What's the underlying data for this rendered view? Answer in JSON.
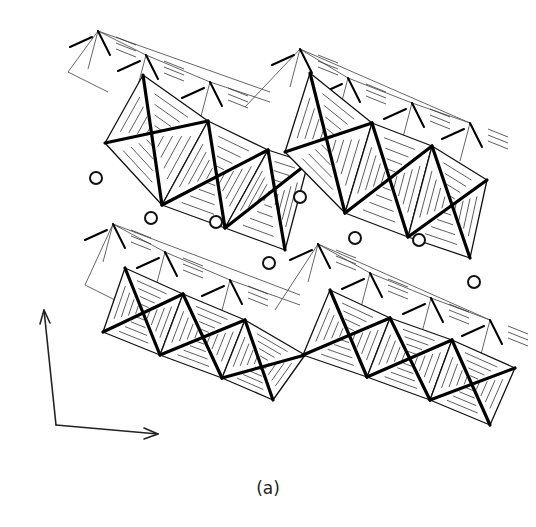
{
  "figure": {
    "type": "crystal-structure-polyhedral-diagram",
    "caption": "(a)",
    "layers": [
      {
        "name": "upper-layer",
        "back_chain": {
          "style": "thin",
          "origin": [
            68,
            72
          ],
          "peaks": [
            [
              98,
              31
            ],
            [
              146,
              55
            ],
            [
              210,
              82
            ],
            [
              270,
              102
            ],
            [
              300,
              49
            ],
            [
              348,
              78
            ],
            [
              412,
              103
            ],
            [
              470,
              123
            ]
          ]
        },
        "front_chains": [
          {
            "offset": [
              0,
              0
            ],
            "octahedra": [
              [
                [
                  143,
                  75
                ],
                [
                  105,
                  143
                ],
                [
                  162,
                  205
                ],
                [
                  208,
                  121
                ]
              ],
              [
                [
                  208,
                  121
                ],
                [
                  162,
                  205
                ],
                [
                  225,
                  228
                ],
                [
                  268,
                  150
                ]
              ],
              [
                [
                  268,
                  150
                ],
                [
                  225,
                  228
                ],
                [
                  285,
                  250
                ],
                [
                  308,
                  163
                ]
              ]
            ]
          },
          {
            "offset": [
              210,
              0
            ],
            "octahedra": [
              [
                [
                  310,
                  73
                ],
                [
                  285,
                  152
                ],
                [
                  345,
                  213
                ],
                [
                  372,
                  123
                ]
              ],
              [
                [
                  372,
                  123
                ],
                [
                  345,
                  213
                ],
                [
                  408,
                  237
                ],
                [
                  432,
                  146
                ]
              ],
              [
                [
                  432,
                  146
                ],
                [
                  408,
                  237
                ],
                [
                  470,
                  258
                ],
                [
                  487,
                  180
                ]
              ]
            ]
          }
        ]
      },
      {
        "name": "lower-layer",
        "back_chain": {
          "style": "thin",
          "origin": [
            85,
            285
          ],
          "peaks": [
            [
              113,
              224
            ],
            [
              165,
              252
            ],
            [
              230,
              280
            ],
            [
              300,
              305
            ],
            [
              318,
              244
            ],
            [
              370,
              273
            ],
            [
              431,
              298
            ],
            [
              490,
              320
            ]
          ]
        },
        "front_chains": [
          {
            "offset": [
              0,
              0
            ],
            "octahedra": [
              [
                [
                  125,
                  268
                ],
                [
                  103,
                  332
                ],
                [
                  160,
                  355
                ],
                [
                  183,
                  294
                ]
              ],
              [
                [
                  183,
                  294
                ],
                [
                  160,
                  355
                ],
                [
                  222,
                  378
                ],
                [
                  245,
                  320
                ]
              ],
              [
                [
                  245,
                  320
                ],
                [
                  222,
                  378
                ],
                [
                  273,
                  400
                ],
                [
                  305,
                  355
                ]
              ]
            ]
          },
          {
            "offset": [
              0,
              0
            ],
            "octahedra": [
              [
                [
                  330,
                  290
                ],
                [
                  303,
                  355
                ],
                [
                  367,
                  377
                ],
                [
                  390,
                  318
                ]
              ],
              [
                [
                  390,
                  318
                ],
                [
                  367,
                  377
                ],
                [
                  430,
                  400
                ],
                [
                  452,
                  340
                ]
              ],
              [
                [
                  452,
                  340
                ],
                [
                  430,
                  400
                ],
                [
                  490,
                  425
                ],
                [
                  515,
                  368
                ]
              ]
            ]
          }
        ]
      }
    ],
    "interlayer_ions": [
      {
        "x": 96,
        "y": 178
      },
      {
        "x": 151,
        "y": 218
      },
      {
        "x": 216,
        "y": 222
      },
      {
        "x": 300,
        "y": 197
      },
      {
        "x": 269,
        "y": 263
      },
      {
        "x": 355,
        "y": 238
      },
      {
        "x": 419,
        "y": 240
      },
      {
        "x": 474,
        "y": 282
      }
    ],
    "axes": {
      "origin": [
        56,
        425
      ],
      "vertical_arrow_tip": [
        44,
        310
      ],
      "horizontal_arrow_tip": [
        158,
        434
      ]
    }
  }
}
